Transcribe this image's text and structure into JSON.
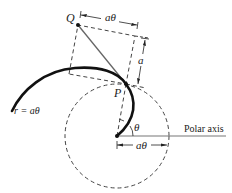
{
  "diagram": {
    "title": "",
    "labels": {
      "point_q": "Q",
      "point_p": "P",
      "spiral_equation": "r = aθ",
      "top_dimension": "aθ",
      "side_dimension": "a",
      "angle": "θ",
      "bottom_dimension": "aθ",
      "polar_axis": "Polar axis"
    },
    "colors": {
      "stroke": "#222222",
      "gray_line": "#777777",
      "background": "#ffffff"
    }
  }
}
